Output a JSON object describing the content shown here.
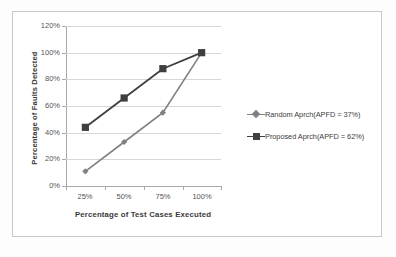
{
  "chart_data": {
    "type": "line",
    "title": "",
    "xlabel": "Percentage of Test Cases Executed",
    "ylabel": "Percentage of Faults Detected",
    "categories": [
      "25%",
      "50%",
      "75%",
      "100%"
    ],
    "x_values": [
      25,
      50,
      75,
      100
    ],
    "ylim": [
      0,
      120
    ],
    "ytick_labels": [
      "0%",
      "20%",
      "40%",
      "60%",
      "80%",
      "100%",
      "120%"
    ],
    "ytick_values": [
      0,
      20,
      40,
      60,
      80,
      100,
      120
    ],
    "grid": true,
    "legend_position": "right",
    "series": [
      {
        "name": "Random Aprch(APFD = 37%)",
        "marker": "diamond",
        "color": "#808080",
        "values": [
          11,
          33,
          55,
          100
        ]
      },
      {
        "name": "Proposed Aprch(APFD = 62%)",
        "marker": "square",
        "color": "#3f3f3f",
        "values": [
          44,
          66,
          88,
          100
        ]
      }
    ]
  },
  "legend": {
    "items": [
      {
        "label": "Random Aprch(APFD = 37%)"
      },
      {
        "label": "Proposed Aprch(APFD = 62%)"
      }
    ]
  },
  "colors": {
    "random_series": "#808080",
    "proposed_series": "#3f3f3f",
    "gridline": "#d6d6d6",
    "axis": "#a8a8a8",
    "frame": "#c9c9c9"
  }
}
